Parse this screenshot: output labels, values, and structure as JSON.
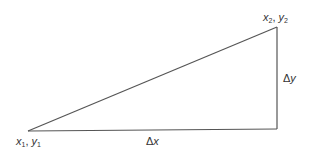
{
  "diagram": {
    "type": "right-triangle-slope",
    "stroke_color": "#555555",
    "vertices": {
      "p1": {
        "x": 28,
        "y": 131
      },
      "p2": {
        "x": 277,
        "y": 27
      },
      "corner": {
        "x": 277,
        "y": 129
      }
    },
    "labels": {
      "p1": {
        "var1": "x",
        "sub1": "1",
        "sep": ", ",
        "var2": "y",
        "sub2": "1"
      },
      "p2": {
        "var1": "x",
        "sub1": "2",
        "sep": ", ",
        "var2": "y",
        "sub2": "2"
      },
      "dx": {
        "delta": "Δ",
        "var": "x"
      },
      "dy": {
        "delta": "Δ",
        "var": "y"
      }
    }
  }
}
